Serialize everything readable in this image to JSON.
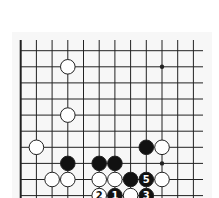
{
  "diagram": {
    "type": "go-board-fragment",
    "grid": {
      "columns": 12,
      "rows": 10,
      "origin_x": 20.7,
      "origin_y": 50.7,
      "col_spacing": 15.7,
      "row_spacing": 16.1,
      "top_edge_y": 40,
      "right_extent_x": 203,
      "left_edge_thick": true
    },
    "colors": {
      "line": "#222222",
      "black_stone": "#111111",
      "white_stone": "#ffffff",
      "stone_outline": "#222222",
      "background": "#f7f7f7"
    },
    "star_points": [
      {
        "col": 9,
        "row": 1
      },
      {
        "col": 9,
        "row": 7
      }
    ],
    "stones": [
      {
        "color": "white",
        "col": 3,
        "row": 1,
        "label": ""
      },
      {
        "color": "white",
        "col": 3,
        "row": 4,
        "label": ""
      },
      {
        "color": "white",
        "col": 1,
        "row": 6,
        "label": ""
      },
      {
        "color": "black",
        "col": 8,
        "row": 6,
        "label": ""
      },
      {
        "color": "white",
        "col": 9,
        "row": 6,
        "label": ""
      },
      {
        "color": "black",
        "col": 3,
        "row": 7,
        "label": ""
      },
      {
        "color": "black",
        "col": 5,
        "row": 7,
        "label": ""
      },
      {
        "color": "black",
        "col": 6,
        "row": 7,
        "label": ""
      },
      {
        "color": "white",
        "col": 2,
        "row": 8,
        "label": ""
      },
      {
        "color": "white",
        "col": 3,
        "row": 8,
        "label": ""
      },
      {
        "color": "white",
        "col": 5,
        "row": 8,
        "label": ""
      },
      {
        "color": "white",
        "col": 6,
        "row": 8,
        "label": ""
      },
      {
        "color": "black",
        "col": 7,
        "row": 8,
        "label": ""
      },
      {
        "color": "black",
        "col": 8,
        "row": 8,
        "label": "5"
      },
      {
        "color": "white",
        "col": 9,
        "row": 8,
        "label": ""
      },
      {
        "color": "white",
        "col": 5,
        "row": 9,
        "label": "2"
      },
      {
        "color": "black",
        "col": 6,
        "row": 9,
        "label": "1"
      },
      {
        "color": "white",
        "col": 7,
        "row": 9,
        "label": ""
      },
      {
        "color": "black",
        "col": 8,
        "row": 9,
        "label": "3"
      }
    ]
  }
}
